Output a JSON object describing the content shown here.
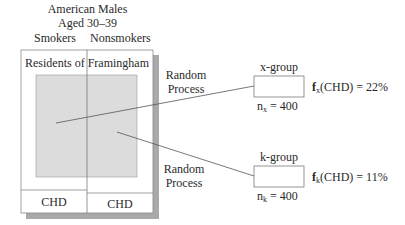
{
  "population": {
    "title_line1": "American Males",
    "title_line2": "Aged 30–39",
    "column_left": "Smokers",
    "column_right": "Nonsmokers",
    "box_label": "Residents of Framingham",
    "outcome_left": "CHD",
    "outcome_right": "CHD"
  },
  "processes": [
    {
      "line1": "Random",
      "line2": "Process"
    },
    {
      "line1": "Random",
      "line2": "Process"
    }
  ],
  "groups": [
    {
      "name": "x-group",
      "n_label": "n",
      "n_sub": "x",
      "n_value": "= 400",
      "f_label": "f",
      "f_sub": "x",
      "f_expr": "(CHD) = 22%"
    },
    {
      "name": "k-group",
      "n_label": "n",
      "n_sub": "k",
      "n_value": "= 400",
      "f_label": "f",
      "f_sub": "k",
      "f_expr": "(CHD) = 11%"
    }
  ],
  "colors": {
    "shadow": "#a9a9a9",
    "inner_fill": "#dcdcdc",
    "line": "#555555",
    "border": "#7a7a7a"
  }
}
